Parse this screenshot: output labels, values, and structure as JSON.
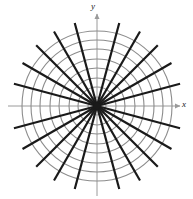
{
  "figure": {
    "title": "",
    "axis_labels": {
      "x": "x",
      "y": "y"
    }
  },
  "chart_data": {
    "type": "scatter",
    "subtype": "polar-grid",
    "title": "",
    "xlabel": "x",
    "ylabel": "y",
    "grid": true,
    "legend": null,
    "center": {
      "x": 97,
      "y": 106
    },
    "circles": {
      "count": 8,
      "radii": [
        9,
        19,
        28,
        38,
        47,
        57,
        66,
        75
      ],
      "color": "#8c8c8c",
      "stroke_width": 1.1,
      "fill": "none"
    },
    "spokes": {
      "count": 24,
      "angle_step_deg": 15,
      "start_angle_deg": 15,
      "inner_radius": 0,
      "outer_radius": 86,
      "color": "#1a1a1a",
      "stroke_width": 2.2,
      "angles_deg": [
        15,
        30,
        45,
        60,
        75,
        105,
        120,
        135,
        150,
        165,
        195,
        210,
        225,
        240,
        255,
        285,
        300,
        315,
        330,
        345,
        0,
        90,
        180,
        270
      ]
    },
    "axes": {
      "color": "#9a9a9a",
      "stroke_width": 1,
      "x_axis": {
        "x1": 8,
        "y1": 106,
        "x2": 180,
        "y2": 106,
        "arrow": "right"
      },
      "y_axis": {
        "x1": 97,
        "y1": 196,
        "x2": 97,
        "y2": 14,
        "arrow": "up"
      }
    },
    "xlim": [
      -86,
      86
    ],
    "ylim": [
      -86,
      86
    ]
  }
}
